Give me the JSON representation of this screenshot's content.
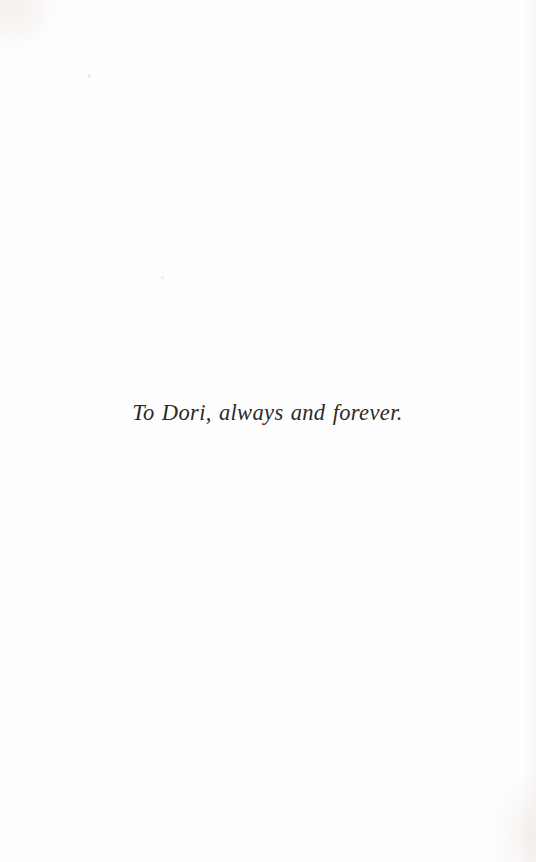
{
  "page": {
    "kind": "book-dedication-page",
    "background_color": "#fffefe",
    "ink_color": "#2b2a28",
    "width_px": 536,
    "height_px": 862
  },
  "dedication": {
    "text": "To Dori, always and forever.",
    "style": "italic-serif",
    "alignment": "center",
    "font_size_px": 22.5,
    "baseline_y_px": 423
  },
  "artifacts": {
    "speck_upper_left": "scan-speck",
    "speck_mid_left": "scan-speck"
  }
}
